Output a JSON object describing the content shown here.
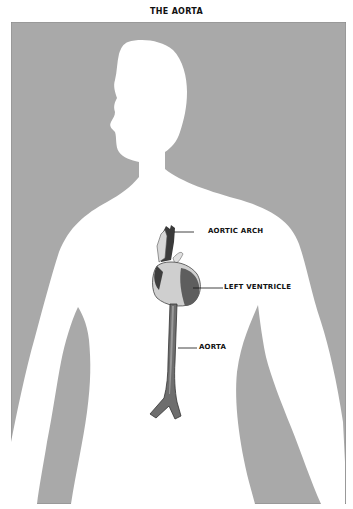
{
  "title": "THE AORTA",
  "labels": {
    "aortic_arch": "AORTIC ARCH",
    "left_ventricle": "LEFT VENTRICLE",
    "aorta": "AORTA"
  },
  "colors": {
    "background_panel": "#a9a9a9",
    "silhouette": "#ffffff",
    "organ_dark": "#3a3a3a",
    "organ_mid": "#7a7a7a",
    "organ_light": "#d8d8d8",
    "text": "#111111"
  }
}
